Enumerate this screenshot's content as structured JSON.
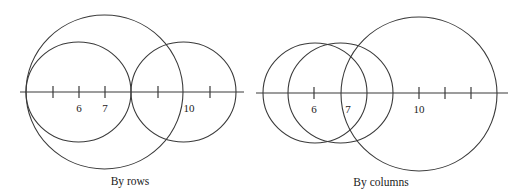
{
  "panels": [
    {
      "caption": "By rows",
      "axis": {
        "x1": 20,
        "x2": 244,
        "y": 92
      },
      "ticks": [
        53,
        79,
        105,
        158,
        210
      ],
      "tick_labels": [
        {
          "text": "6",
          "x": 79,
          "y": 112
        },
        {
          "text": "7",
          "x": 105,
          "y": 112
        },
        {
          "text": "10",
          "x": 189,
          "y": 112
        }
      ],
      "circles": [
        {
          "cx": 104.5,
          "cy": 92,
          "rx": 78.5,
          "ry": 77
        },
        {
          "cx": 78.5,
          "cy": 92,
          "rx": 52.5,
          "ry": 50
        },
        {
          "cx": 183.5,
          "cy": 92,
          "rx": 52.5,
          "ry": 50
        }
      ],
      "caption_pos": {
        "x": 130,
        "y": 185
      }
    },
    {
      "caption": "By columns",
      "axis": {
        "x1": 256,
        "x2": 508,
        "y": 93
      },
      "ticks": [
        314,
        419,
        445,
        471
      ],
      "tick_labels": [
        {
          "text": "6",
          "x": 314,
          "y": 113
        },
        {
          "text": "7",
          "x": 348,
          "y": 113
        },
        {
          "text": "10",
          "x": 419,
          "y": 113
        }
      ],
      "circles": [
        {
          "cx": 315,
          "cy": 93,
          "rx": 52,
          "ry": 50
        },
        {
          "cx": 340.5,
          "cy": 93,
          "rx": 52.5,
          "ry": 50
        },
        {
          "cx": 419,
          "cy": 94,
          "rx": 78,
          "ry": 77
        }
      ],
      "caption_pos": {
        "x": 381,
        "y": 186
      }
    }
  ]
}
